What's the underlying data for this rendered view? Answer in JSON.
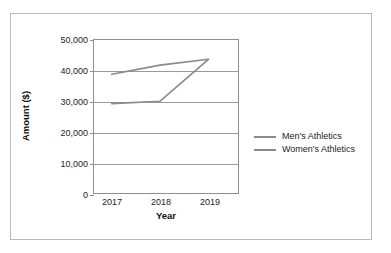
{
  "chart_data": {
    "type": "line",
    "title": "",
    "xlabel": "Year",
    "ylabel": "Amount ($)",
    "categories": [
      "2017",
      "2018",
      "2019"
    ],
    "series": [
      {
        "name": "Men's Athletics",
        "values": [
          38800,
          41800,
          43700
        ],
        "color": "#8a8a8a"
      },
      {
        "name": "Women's Athletics",
        "values": [
          29200,
          30000,
          43700
        ],
        "color": "#8a8a8a"
      }
    ],
    "ylim": [
      0,
      50000
    ],
    "yticks": [
      0,
      10000,
      20000,
      30000,
      40000,
      50000
    ],
    "ytick_labels": [
      "0",
      "10,000",
      "20,000",
      "30,000",
      "40,000",
      "50,000"
    ],
    "grid": true,
    "legend_position": "right",
    "frame_color": "#8f8f8f",
    "grid_color": "#9a9a9a",
    "border_color": "#b9b9b9",
    "background": "#ffffff"
  },
  "axes": {
    "y_title": "Amount ($)",
    "x_title": "Year"
  },
  "legend": {
    "items": [
      {
        "label": "Men's Athletics",
        "color": "#8a8a8a"
      },
      {
        "label": "Women's Athletics",
        "color": "#8a8a8a"
      }
    ]
  }
}
